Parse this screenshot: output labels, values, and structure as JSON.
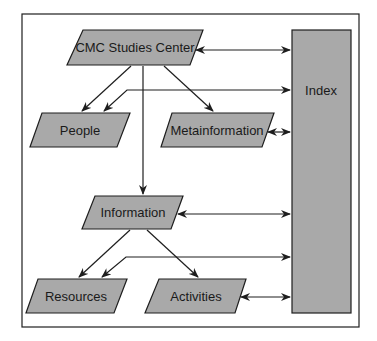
{
  "diagram": {
    "colors": {
      "node_fill": "#a9a9a9",
      "stroke": "#1e1e1e",
      "background": "#ffffff"
    },
    "nodes": [
      {
        "id": "cmc",
        "label": "CMC Studies Center",
        "shape": "parallelogram"
      },
      {
        "id": "people",
        "label": "People",
        "shape": "parallelogram"
      },
      {
        "id": "meta",
        "label": "Metainformation",
        "shape": "parallelogram"
      },
      {
        "id": "info",
        "label": "Information",
        "shape": "parallelogram"
      },
      {
        "id": "resources",
        "label": "Resources",
        "shape": "parallelogram"
      },
      {
        "id": "activities",
        "label": "Activities",
        "shape": "parallelogram"
      },
      {
        "id": "index",
        "label": "Index",
        "shape": "rectangle"
      }
    ],
    "edges": [
      {
        "from": "cmc",
        "to": "people",
        "type": "directed"
      },
      {
        "from": "cmc",
        "to": "meta",
        "type": "directed"
      },
      {
        "from": "cmc",
        "to": "info",
        "type": "directed"
      },
      {
        "from": "cmc",
        "to": "index",
        "type": "bidirectional"
      },
      {
        "from": "index",
        "to": "people",
        "type": "bidirectional"
      },
      {
        "from": "meta",
        "to": "index",
        "type": "bidirectional"
      },
      {
        "from": "info",
        "to": "resources",
        "type": "directed"
      },
      {
        "from": "info",
        "to": "activities",
        "type": "directed"
      },
      {
        "from": "info",
        "to": "index",
        "type": "bidirectional"
      },
      {
        "from": "index",
        "to": "resources",
        "type": "bidirectional"
      },
      {
        "from": "activities",
        "to": "index",
        "type": "bidirectional"
      }
    ]
  }
}
